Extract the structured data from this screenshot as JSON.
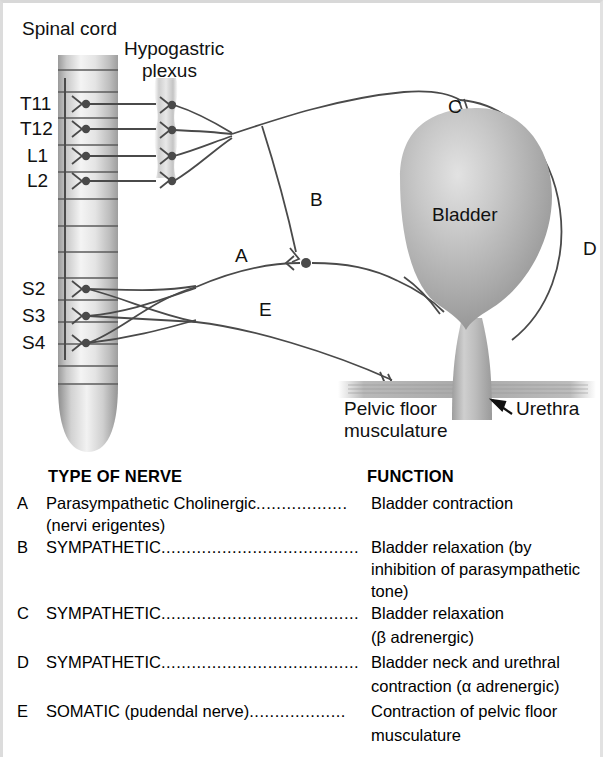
{
  "figure": {
    "title_labels": {
      "spinal_cord": "Spinal cord",
      "hypogastric_plexus_line1": "Hypogastric",
      "hypogastric_plexus_line2": "plexus"
    },
    "spinal_segments": [
      "T11",
      "T12",
      "L1",
      "L2",
      "S2",
      "S3",
      "S4"
    ],
    "organ_labels": {
      "bladder": "Bladder",
      "urethra": "Urethra",
      "pelvic_floor_line1": "Pelvic floor",
      "pelvic_floor_line2": "musculature"
    },
    "nerve_markers": [
      "A",
      "B",
      "C",
      "D",
      "E"
    ],
    "colors": {
      "line": "#4a4a4a",
      "tissue_light": "#e6e6e6",
      "tissue_mid": "#b4b4b4",
      "tissue_dark": "#8d8d8d",
      "text": "#111111"
    }
  },
  "legend": {
    "headers": {
      "type_of_nerve": "TYPE OF NERVE",
      "function": "FUNCTION"
    },
    "rows": [
      {
        "key": "A",
        "nerve": "Parasympathetic Cholinergic",
        "leader": "..................",
        "nerve_sub": "(nervi erigentes)",
        "function": "Bladder contraction"
      },
      {
        "key": "B",
        "nerve": "SYMPATHETIC",
        "leader": ".......................................",
        "nerve_sub": "",
        "function": "Bladder relaxation (by",
        "function_line2": "inhibition of parasympathetic",
        "function_line3": "tone)"
      },
      {
        "key": "C",
        "nerve": "SYMPATHETIC",
        "leader": ".......................................",
        "nerve_sub": "",
        "function": "Bladder relaxation",
        "function_line2": "(β adrenergic)"
      },
      {
        "key": "D",
        "nerve": "SYMPATHETIC",
        "leader": ".......................................",
        "nerve_sub": "",
        "function": "Bladder neck and urethral",
        "function_line2": "contraction (α adrenergic)"
      },
      {
        "key": "E",
        "nerve": "SOMATIC (pudendal nerve)",
        "leader": "...................",
        "nerve_sub": "",
        "function": "Contraction of pelvic floor",
        "function_line2": "musculature"
      }
    ]
  }
}
